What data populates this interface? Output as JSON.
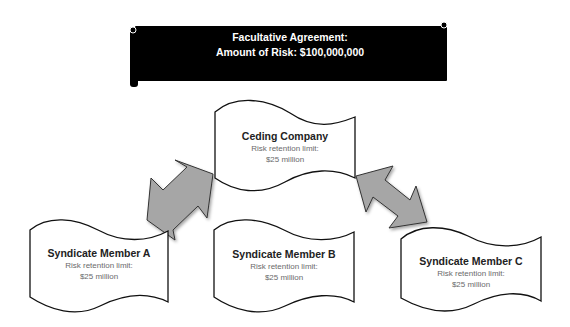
{
  "banner": {
    "line1": "Facultative Agreement:",
    "line2": "Amount of Risk: $100,000,000",
    "background": "#000000",
    "text_color": "#ffffff"
  },
  "nodes": {
    "ceding": {
      "title": "Ceding Company",
      "label": "Risk retention limit:",
      "value": "$25 million"
    },
    "member_a": {
      "title": "Syndicate Member A",
      "label": "Risk retention limit:",
      "value": "$25 million"
    },
    "member_b": {
      "title": "Syndicate Member B",
      "label": "Risk retention limit:",
      "value": "$25 million"
    },
    "member_c": {
      "title": "Syndicate Member C",
      "label": "Risk retention limit:",
      "value": "$25 million"
    }
  },
  "arrows": [
    {
      "name": "arrow-ceding-member-a",
      "type": "double-headed",
      "fill": "#a6a6a6",
      "from": "Ceding Company",
      "to": "Syndicate Member A"
    },
    {
      "name": "arrow-ceding-member-c",
      "type": "double-headed",
      "fill": "#a6a6a6",
      "from": "Ceding Company",
      "to": "Syndicate Member C"
    }
  ],
  "colors": {
    "arrow_fill": "#a6a6a6",
    "shape_stroke": "#111111",
    "title_text": "#222222",
    "sub_text": "#6a6a6a"
  }
}
